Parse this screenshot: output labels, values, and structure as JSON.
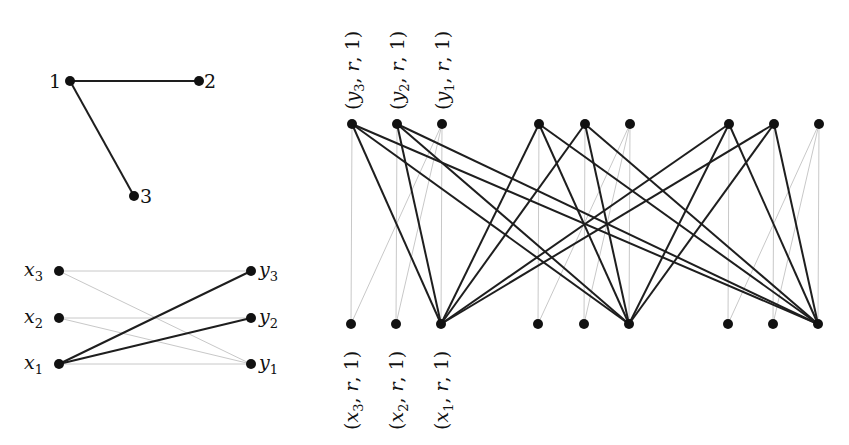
{
  "triangle_graph": {
    "nodes": [
      {
        "id": "1",
        "label": "1",
        "x": 70,
        "y": 81
      },
      {
        "id": "2",
        "label": "2",
        "x": 199,
        "y": 81
      },
      {
        "id": "3",
        "label": "3",
        "x": 134,
        "y": 196
      }
    ],
    "edges": [
      [
        "1",
        "2"
      ],
      [
        "1",
        "3"
      ]
    ]
  },
  "bipartite_graph": {
    "left": [
      {
        "id": "x3",
        "label": "x",
        "sub": "3",
        "x": 59,
        "y": 271
      },
      {
        "id": "x2",
        "label": "x",
        "sub": "2",
        "x": 59,
        "y": 318
      },
      {
        "id": "x1",
        "label": "x",
        "sub": "1",
        "x": 59,
        "y": 364
      }
    ],
    "right": [
      {
        "id": "y3",
        "label": "y",
        "sub": "3",
        "x": 251,
        "y": 271
      },
      {
        "id": "y2",
        "label": "y",
        "sub": "2",
        "x": 251,
        "y": 318
      },
      {
        "id": "y1",
        "label": "y",
        "sub": "1",
        "x": 251,
        "y": 364
      }
    ],
    "dark_edges": [
      [
        "x1",
        "y3"
      ],
      [
        "x1",
        "y2"
      ]
    ],
    "light_edges": [
      [
        "x3",
        "y3"
      ],
      [
        "x2",
        "y2"
      ],
      [
        "x1",
        "y1"
      ],
      [
        "x3",
        "y1"
      ],
      [
        "x2",
        "y1"
      ]
    ]
  },
  "large_graph": {
    "top_y": 124,
    "bottom_y": 324,
    "top_x": [
      352,
      397,
      442,
      539,
      585,
      630,
      729,
      774,
      819
    ],
    "bottom_x": [
      351,
      396,
      441,
      538,
      584,
      629,
      728,
      773,
      818
    ],
    "top_labels": [
      "(y3, r, 1)",
      "(y2, r, 1)",
      "(y1, r, 1)"
    ],
    "bottom_labels": [
      "(x3, r, 1)",
      "(x2, r, 1)",
      "(x1, r, 1)"
    ],
    "dark_edges_note": "top nodes 0,1,3,4,6,7 connect to bottom nodes 2,5,8",
    "dark_top": [
      0,
      1,
      3,
      4,
      6,
      7
    ],
    "dark_bottom": [
      2,
      5,
      8
    ],
    "light_edges": [
      [
        0,
        0
      ],
      [
        1,
        1
      ],
      [
        2,
        2
      ],
      [
        3,
        3
      ],
      [
        4,
        4
      ],
      [
        5,
        5
      ],
      [
        6,
        6
      ],
      [
        7,
        7
      ],
      [
        8,
        8
      ],
      [
        2,
        0
      ],
      [
        2,
        1
      ],
      [
        5,
        3
      ],
      [
        5,
        4
      ],
      [
        8,
        6
      ],
      [
        8,
        7
      ]
    ]
  }
}
